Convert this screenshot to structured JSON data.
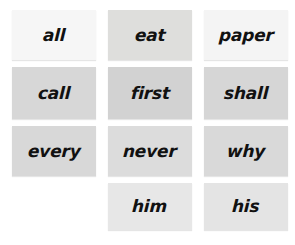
{
  "board": {
    "name": "sight-word-flashcard-grid",
    "background_color": "#ffffff",
    "columns": 3,
    "rows": 4,
    "total_cards": 11
  },
  "cards": [
    {
      "word": "all",
      "bg": "#f6f6f6",
      "text_color": "#111111",
      "row": 1,
      "col": 1
    },
    {
      "word": "eat",
      "bg": "#dededc",
      "text_color": "#111111",
      "row": 1,
      "col": 2
    },
    {
      "word": "paper",
      "bg": "#f4f4f4",
      "text_color": "#111111",
      "row": 1,
      "col": 3
    },
    {
      "word": "call",
      "bg": "#d7d7d7",
      "text_color": "#111111",
      "row": 2,
      "col": 1
    },
    {
      "word": "first",
      "bg": "#d2d2d2",
      "text_color": "#111111",
      "row": 2,
      "col": 2
    },
    {
      "word": "shall",
      "bg": "#d6d6d6",
      "text_color": "#111111",
      "row": 2,
      "col": 3
    },
    {
      "word": "every",
      "bg": "#d8d8d8",
      "text_color": "#111111",
      "row": 3,
      "col": 1
    },
    {
      "word": "never",
      "bg": "#dcdcdc",
      "text_color": "#111111",
      "row": 3,
      "col": 2
    },
    {
      "word": "why",
      "bg": "#d9d9d9",
      "text_color": "#111111",
      "row": 3,
      "col": 3
    },
    {
      "word": "",
      "bg": "transparent",
      "text_color": "#111111",
      "row": 4,
      "col": 1,
      "empty": true
    },
    {
      "word": "him",
      "bg": "#e7e7e7",
      "text_color": "#111111",
      "row": 4,
      "col": 2
    },
    {
      "word": "his",
      "bg": "#e4e4e4",
      "text_color": "#111111",
      "row": 4,
      "col": 3
    }
  ]
}
